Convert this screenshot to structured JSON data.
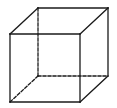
{
  "diagram": {
    "stroke_color": "#1a1a1a",
    "background": "#ffffff",
    "vertices": {
      "front_top_left": [
        10,
        34
      ],
      "front_top_right": [
        80,
        34
      ],
      "front_bottom_left": [
        10,
        102
      ],
      "front_bottom_right": [
        80,
        102
      ],
      "back_top_left": [
        38,
        8
      ],
      "back_top_right": [
        108,
        8
      ],
      "back_bottom_left": [
        38,
        76
      ],
      "back_bottom_right": [
        108,
        76
      ]
    },
    "solid_edges": [
      [
        "front_top_left",
        "front_top_right"
      ],
      [
        "front_top_right",
        "front_bottom_right"
      ],
      [
        "front_bottom_right",
        "front_bottom_left"
      ],
      [
        "front_bottom_left",
        "front_top_left"
      ],
      [
        "front_top_left",
        "back_top_left"
      ],
      [
        "back_top_left",
        "back_top_right"
      ],
      [
        "back_top_right",
        "front_top_right"
      ],
      [
        "back_top_right",
        "back_bottom_right"
      ],
      [
        "back_bottom_right",
        "front_bottom_right"
      ]
    ],
    "hidden_edges": [
      [
        "back_top_left",
        "back_bottom_left"
      ],
      [
        "back_bottom_left",
        "back_bottom_right"
      ],
      [
        "back_bottom_left",
        "front_bottom_left"
      ]
    ]
  }
}
